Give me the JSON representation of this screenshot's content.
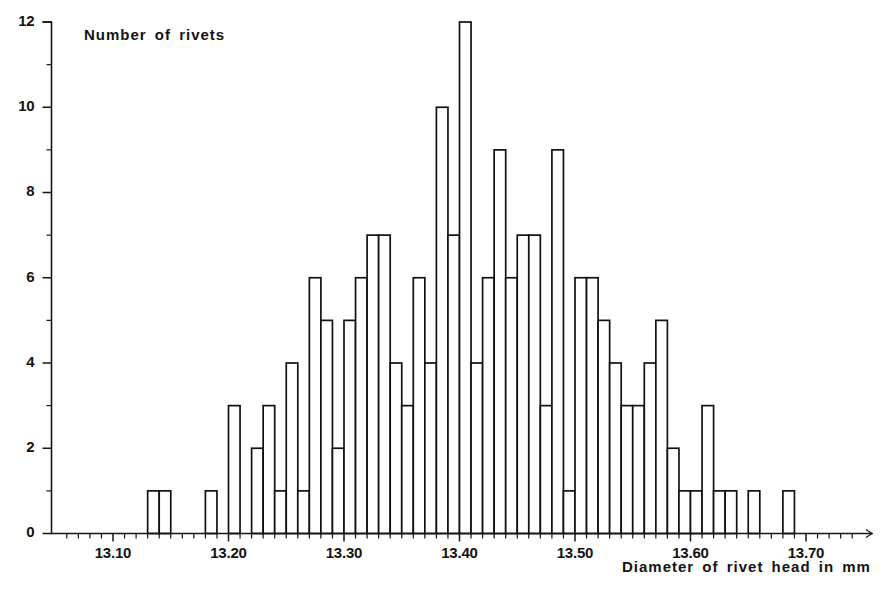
{
  "figure": {
    "background_color": "#ffffff",
    "ink_color": "#111111"
  },
  "chart_data": {
    "type": "bar",
    "title": "",
    "subtitle": "",
    "xlabel": "Diameter of rivet head in mm",
    "ylabel": "Number of rivets",
    "grid": false,
    "legend": false,
    "legend_position": "none",
    "bin_width": 0.01,
    "xlim": [
      13.06,
      13.74
    ],
    "ylim": [
      0,
      12
    ],
    "x_tick_labels": [
      "13.10",
      "13.20",
      "13.30",
      "13.40",
      "13.50",
      "13.60",
      "13.70"
    ],
    "x_tick_values": [
      13.1,
      13.2,
      13.3,
      13.4,
      13.5,
      13.6,
      13.7
    ],
    "x_minor_tick_step": 0.01,
    "y_tick_labels": [
      "0",
      "2",
      "4",
      "6",
      "8",
      "10",
      "12"
    ],
    "y_tick_values": [
      0,
      2,
      4,
      6,
      8,
      10,
      12
    ],
    "y_minor_tick_step": 1,
    "categories": [
      "13.13",
      "13.14",
      "13.18",
      "13.20",
      "13.22",
      "13.23",
      "13.24",
      "13.25",
      "13.26",
      "13.27",
      "13.28",
      "13.29",
      "13.30",
      "13.31",
      "13.32",
      "13.33",
      "13.34",
      "13.35",
      "13.36",
      "13.37",
      "13.38",
      "13.39",
      "13.40",
      "13.41",
      "13.42",
      "13.43",
      "13.44",
      "13.45",
      "13.46",
      "13.47",
      "13.48",
      "13.49",
      "13.50",
      "13.51",
      "13.52",
      "13.53",
      "13.54",
      "13.55",
      "13.56",
      "13.57",
      "13.58",
      "13.59",
      "13.60",
      "13.61",
      "13.62",
      "13.63",
      "13.65",
      "13.68"
    ],
    "values": [
      1,
      1,
      1,
      3,
      2,
      3,
      1,
      4,
      1,
      6,
      5,
      2,
      5,
      6,
      7,
      7,
      4,
      3,
      6,
      4,
      10,
      7,
      12,
      4,
      6,
      9,
      6,
      7,
      7,
      3,
      9,
      1,
      6,
      6,
      5,
      4,
      3,
      3,
      4,
      5,
      2,
      1,
      1,
      3,
      1,
      1,
      1,
      1
    ],
    "bars": [
      {
        "x": 13.13,
        "y": 1
      },
      {
        "x": 13.14,
        "y": 1
      },
      {
        "x": 13.18,
        "y": 1
      },
      {
        "x": 13.2,
        "y": 3
      },
      {
        "x": 13.22,
        "y": 2
      },
      {
        "x": 13.23,
        "y": 3
      },
      {
        "x": 13.24,
        "y": 1
      },
      {
        "x": 13.25,
        "y": 4
      },
      {
        "x": 13.26,
        "y": 1
      },
      {
        "x": 13.27,
        "y": 6
      },
      {
        "x": 13.28,
        "y": 5
      },
      {
        "x": 13.29,
        "y": 2
      },
      {
        "x": 13.3,
        "y": 5
      },
      {
        "x": 13.31,
        "y": 6
      },
      {
        "x": 13.32,
        "y": 7
      },
      {
        "x": 13.33,
        "y": 7
      },
      {
        "x": 13.34,
        "y": 4
      },
      {
        "x": 13.35,
        "y": 3
      },
      {
        "x": 13.36,
        "y": 6
      },
      {
        "x": 13.37,
        "y": 4
      },
      {
        "x": 13.38,
        "y": 10
      },
      {
        "x": 13.39,
        "y": 7
      },
      {
        "x": 13.4,
        "y": 12
      },
      {
        "x": 13.41,
        "y": 4
      },
      {
        "x": 13.42,
        "y": 6
      },
      {
        "x": 13.43,
        "y": 9
      },
      {
        "x": 13.44,
        "y": 6
      },
      {
        "x": 13.45,
        "y": 7
      },
      {
        "x": 13.46,
        "y": 7
      },
      {
        "x": 13.47,
        "y": 3
      },
      {
        "x": 13.48,
        "y": 9
      },
      {
        "x": 13.49,
        "y": 1
      },
      {
        "x": 13.5,
        "y": 6
      },
      {
        "x": 13.51,
        "y": 6
      },
      {
        "x": 13.52,
        "y": 5
      },
      {
        "x": 13.53,
        "y": 4
      },
      {
        "x": 13.54,
        "y": 3
      },
      {
        "x": 13.55,
        "y": 3
      },
      {
        "x": 13.56,
        "y": 4
      },
      {
        "x": 13.57,
        "y": 5
      },
      {
        "x": 13.58,
        "y": 2
      },
      {
        "x": 13.59,
        "y": 1
      },
      {
        "x": 13.6,
        "y": 1
      },
      {
        "x": 13.61,
        "y": 3
      },
      {
        "x": 13.62,
        "y": 1
      },
      {
        "x": 13.63,
        "y": 1
      },
      {
        "x": 13.65,
        "y": 1
      },
      {
        "x": 13.68,
        "y": 1
      }
    ]
  }
}
